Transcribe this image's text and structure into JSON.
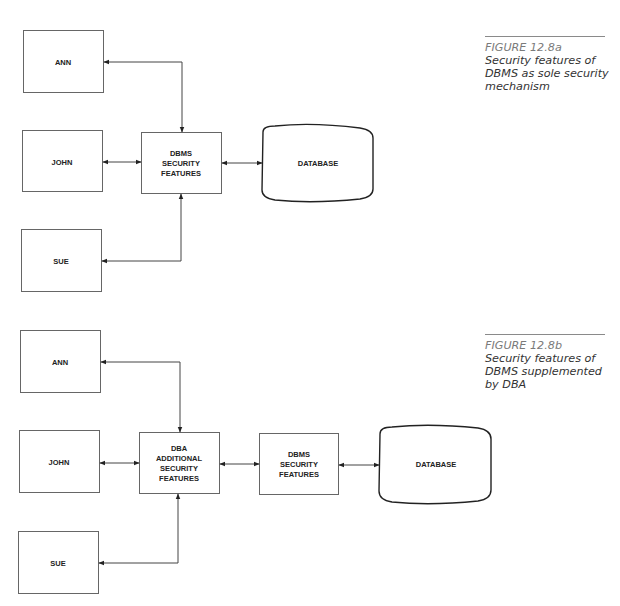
{
  "figure_a": {
    "caption": {
      "label": "FIGURE 12.8a",
      "text_lines": [
        "Security features of",
        "DBMS as sole security",
        "mechanism"
      ]
    },
    "nodes": {
      "ann": "ANN",
      "john": "JOHN",
      "sue": "SUE",
      "dbms_security": [
        "DBMS",
        "SECURITY",
        "FEATURES"
      ],
      "database": "DATABASE"
    },
    "edges": [
      {
        "from": "ANN",
        "to": "DBMS SECURITY FEATURES",
        "bidirectional": true
      },
      {
        "from": "JOHN",
        "to": "DBMS SECURITY FEATURES",
        "bidirectional": true
      },
      {
        "from": "SUE",
        "to": "DBMS SECURITY FEATURES",
        "bidirectional": true
      },
      {
        "from": "DBMS SECURITY FEATURES",
        "to": "DATABASE",
        "bidirectional": true
      }
    ]
  },
  "figure_b": {
    "caption": {
      "label": "FIGURE 12.8b",
      "text_lines": [
        "Security features of",
        "DBMS supplemented",
        "by DBA"
      ]
    },
    "nodes": {
      "ann": "ANN",
      "john": "JOHN",
      "sue": "SUE",
      "dba_security": [
        "DBA",
        "ADDITIONAL",
        "SECURITY",
        "FEATURES"
      ],
      "dbms_security": [
        "DBMS",
        "SECURITY",
        "FEATURES"
      ],
      "database": "DATABASE"
    },
    "edges": [
      {
        "from": "ANN",
        "to": "DBA ADDITIONAL SECURITY FEATURES",
        "bidirectional": true
      },
      {
        "from": "JOHN",
        "to": "DBA ADDITIONAL SECURITY FEATURES",
        "bidirectional": true
      },
      {
        "from": "SUE",
        "to": "DBA ADDITIONAL SECURITY FEATURES",
        "bidirectional": true
      },
      {
        "from": "DBA ADDITIONAL SECURITY FEATURES",
        "to": "DBMS SECURITY FEATURES",
        "bidirectional": true
      },
      {
        "from": "DBMS SECURITY FEATURES",
        "to": "DATABASE",
        "bidirectional": true
      }
    ]
  },
  "colors": {
    "stroke": "#555555",
    "arrow": "#222222",
    "text": "#222222",
    "caption_label": "#7a7a7a",
    "caption_text": "#333333"
  }
}
